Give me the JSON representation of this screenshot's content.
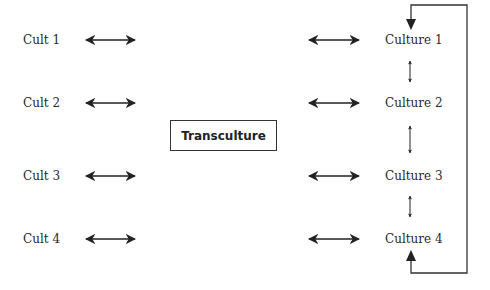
{
  "diagram": {
    "left_nodes": [
      {
        "label": "Cult 1"
      },
      {
        "label": "Cult 2"
      },
      {
        "label": "Cult 3"
      },
      {
        "label": "Cult 4"
      }
    ],
    "center_node": {
      "label": "Transculture"
    },
    "right_nodes": [
      {
        "label": "Culture 1"
      },
      {
        "label": "Culture 2"
      },
      {
        "label": "Culture 3"
      },
      {
        "label": "Culture 4"
      }
    ],
    "edges": [
      {
        "from": "Cult 1",
        "to": "Transculture",
        "type": "bidirectional"
      },
      {
        "from": "Cult 2",
        "to": "Transculture",
        "type": "bidirectional"
      },
      {
        "from": "Cult 3",
        "to": "Transculture",
        "type": "bidirectional"
      },
      {
        "from": "Cult 4",
        "to": "Transculture",
        "type": "bidirectional"
      },
      {
        "from": "Transculture",
        "to": "Culture 1",
        "type": "bidirectional"
      },
      {
        "from": "Transculture",
        "to": "Culture 2",
        "type": "bidirectional"
      },
      {
        "from": "Transculture",
        "to": "Culture 3",
        "type": "bidirectional"
      },
      {
        "from": "Transculture",
        "to": "Culture 4",
        "type": "bidirectional"
      },
      {
        "from": "Culture 1",
        "to": "Culture 2",
        "type": "bidirectional"
      },
      {
        "from": "Culture 2",
        "to": "Culture 3",
        "type": "bidirectional"
      },
      {
        "from": "Culture 3",
        "to": "Culture 4",
        "type": "bidirectional"
      },
      {
        "from": "loop",
        "to": "Culture 1",
        "type": "feedback-loop"
      },
      {
        "from": "loop",
        "to": "Culture 4",
        "type": "feedback-loop"
      }
    ]
  }
}
